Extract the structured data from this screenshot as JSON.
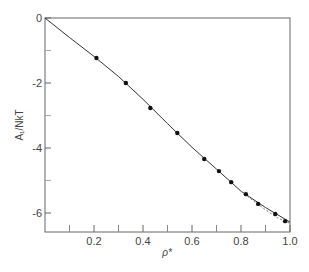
{
  "chart_data": {
    "type": "line",
    "title": "",
    "xlabel": "ρ*",
    "ylabel": "A_I / NkT",
    "xlim": [
      0,
      1.0
    ],
    "ylim": [
      -6.6,
      0
    ],
    "grid": false,
    "legend": null,
    "x_ticks": [
      0.2,
      0.4,
      0.6,
      0.8,
      1.0
    ],
    "x_tick_labels": [
      "0.2",
      "0.4",
      "0.6",
      "0.8",
      "1.0"
    ],
    "x_minor_ticks": [
      0.1,
      0.3,
      0.5,
      0.7,
      0.9
    ],
    "y_ticks": [
      0,
      -2,
      -4,
      -6
    ],
    "y_tick_labels": [
      "0",
      "-2",
      "-4",
      "-6"
    ],
    "y_minor_ticks": [
      -1,
      -3,
      -5
    ],
    "series": [
      {
        "name": "theory (solid curve)",
        "style": "solid",
        "x": [
          0.0,
          0.1,
          0.2,
          0.3,
          0.4,
          0.5,
          0.6,
          0.7,
          0.8,
          0.9,
          1.0
        ],
        "y": [
          0.0,
          -0.6,
          -1.18,
          -1.8,
          -2.5,
          -3.25,
          -3.98,
          -4.65,
          -5.33,
          -5.83,
          -6.28
        ]
      },
      {
        "name": "alternative (dashed curve)",
        "style": "dashed",
        "x": [
          0.8,
          0.85,
          0.9,
          0.95,
          1.0
        ],
        "y": [
          -5.33,
          -5.62,
          -5.9,
          -6.15,
          -6.32
        ]
      },
      {
        "name": "simulation (points)",
        "style": "markers",
        "x": [
          0.21,
          0.33,
          0.43,
          0.54,
          0.65,
          0.71,
          0.76,
          0.82,
          0.87,
          0.94,
          0.98
        ],
        "y": [
          -1.23,
          -2.0,
          -2.77,
          -3.54,
          -4.34,
          -4.71,
          -5.05,
          -5.42,
          -5.72,
          -6.03,
          -6.25
        ]
      }
    ]
  }
}
